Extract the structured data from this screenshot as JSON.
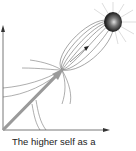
{
  "figure": {
    "caption": "The higher self as a",
    "elements": {
      "axes": "x-y-axes-with-arrowheads",
      "vector": "thick-gray-arrow-from-origin",
      "field": "elliptical-field-lines",
      "source": "dark-glowing-sphere-with-rays",
      "small_arrow": "inner-direction-arrow"
    },
    "colors": {
      "axis": "#555555",
      "vector": "#9a9a9a",
      "field_lines": "#6a6a6a",
      "sphere_dark": "#1a1a1a",
      "sphere_highlight": "#d8d8d8",
      "rays": "#cfcfcf"
    }
  }
}
